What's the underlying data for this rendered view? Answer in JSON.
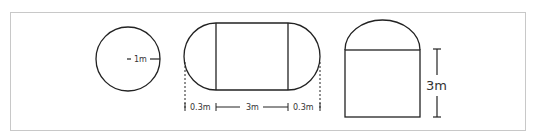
{
  "diagram": {
    "shapes": [
      {
        "name": "circle",
        "label": "1m"
      },
      {
        "name": "stadium",
        "labels": {
          "left_cap": "0.3m",
          "middle": "3m",
          "right_cap": "0.3m"
        }
      },
      {
        "name": "dome-rect",
        "label": "3m"
      }
    ],
    "colors": {
      "stroke": "#222222",
      "frame": "#c8c8c8"
    }
  }
}
